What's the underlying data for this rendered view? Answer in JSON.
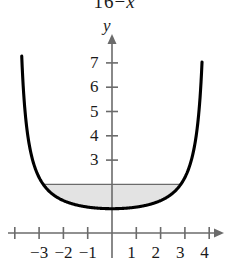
{
  "figure": {
    "title_fragment": {
      "number": "16",
      "operator": "−",
      "variable": "x"
    },
    "axis_labels": {
      "y": "y"
    },
    "colors": {
      "curve": "#000000",
      "axis": "#6b6b6b",
      "shading_fill": "#e3e3e3",
      "shading_top_line": "#6b6b6b",
      "text": "#1a1a1a",
      "background": "#ffffff"
    }
  },
  "chart_data": {
    "type": "line",
    "title": "",
    "subtitle": "",
    "xlabel": "",
    "ylabel": "y",
    "xlim": [
      -4.6,
      4.9
    ],
    "ylim": [
      -0.9,
      8.6
    ],
    "grid": false,
    "legend": null,
    "x_ticks": [
      -4,
      -3,
      -2,
      -1,
      1,
      2,
      3,
      4
    ],
    "x_tick_labels": [
      "",
      "−3",
      "−2",
      "−1",
      "1",
      "2",
      "3",
      "4"
    ],
    "y_ticks": [
      1,
      3,
      4,
      5,
      6,
      7
    ],
    "y_tick_labels": [
      "",
      "3",
      "4",
      "5",
      "6",
      "7"
    ],
    "function": "y = 16 / (16 − x²)",
    "series": [
      {
        "name": "y = 16/(16 − x²)",
        "x": [
          -3.72,
          -3.7,
          -3.65,
          -3.6,
          -3.5,
          -3.4,
          -3.3,
          -3.2,
          -3.1,
          -3.0,
          -2.8,
          -2.6,
          -2.4,
          -2.2,
          -2.0,
          -1.8,
          -1.6,
          -1.4,
          -1.2,
          -1.0,
          -0.8,
          -0.6,
          -0.4,
          -0.2,
          0.0,
          0.2,
          0.4,
          0.6,
          0.8,
          1.0,
          1.2,
          1.4,
          1.6,
          1.8,
          2.0,
          2.2,
          2.4,
          2.6,
          2.8,
          3.0,
          3.1,
          3.2,
          3.3,
          3.4,
          3.5,
          3.6,
          3.65,
          3.7,
          3.72
        ],
        "y": [
          7.41,
          7.02,
          6.22,
          5.62,
          4.74,
          4.15,
          3.72,
          3.4,
          3.15,
          2.29,
          2.24,
          1.73,
          1.56,
          1.44,
          1.33,
          1.29,
          1.25,
          1.1,
          1.1,
          1.07,
          1.04,
          1.02,
          1.01,
          1.0,
          1.0,
          1.0,
          1.01,
          1.02,
          1.04,
          1.07,
          1.1,
          1.1,
          1.25,
          1.29,
          1.33,
          1.44,
          1.56,
          1.73,
          2.24,
          2.29,
          3.15,
          3.4,
          3.72,
          4.15,
          4.74,
          5.62,
          6.22,
          7.02,
          7.41
        ],
        "color": "#000000",
        "width": 3
      }
    ],
    "shaded_region": {
      "description": "Region between the curve and the horizontal line y = 2",
      "upper_bound": 2,
      "lower_bound_curve": "y = 16 / (16 − x²)",
      "x_from": -2.94,
      "x_to": 2.94,
      "fill": "#e3e3e3"
    },
    "annotations": [
      {
        "text": "y",
        "x": 0,
        "y": 8.4,
        "role": "axis-name"
      }
    ]
  }
}
